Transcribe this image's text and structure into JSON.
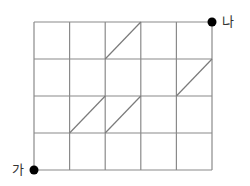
{
  "diagram": {
    "type": "grid-path",
    "columns": 5,
    "rows": 4,
    "grid_color": "#8a8a8a",
    "dot_color": "#000000",
    "start": {
      "label": "가",
      "col": 0,
      "row": 0
    },
    "end": {
      "label": "나",
      "col": 5,
      "row": 4
    },
    "diagonals": [
      {
        "from": [
          2,
          3
        ],
        "to": [
          3,
          4
        ]
      },
      {
        "from": [
          4,
          2
        ],
        "to": [
          5,
          3
        ]
      },
      {
        "from": [
          1,
          1
        ],
        "to": [
          2,
          2
        ]
      },
      {
        "from": [
          2,
          1
        ],
        "to": [
          3,
          2
        ]
      }
    ]
  },
  "labels": {
    "start": "가",
    "end": "나"
  }
}
